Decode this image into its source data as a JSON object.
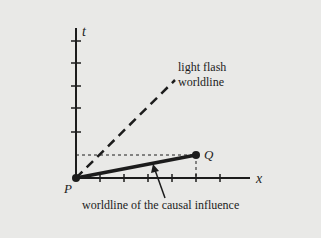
{
  "diagram": {
    "axes": {
      "t_label": "t",
      "x_label": "x"
    },
    "points": {
      "origin_label": "P",
      "event_label": "Q"
    },
    "annotations": {
      "light_line1": "light flash",
      "light_line2": "worldline",
      "causal": "worldline of the causal influence"
    },
    "colors": {
      "background": "#e9e9e7",
      "ink": "#1c1c1c"
    }
  }
}
